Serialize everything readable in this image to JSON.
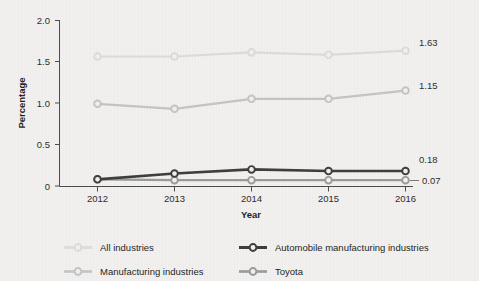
{
  "chart_data": {
    "type": "line",
    "title": "",
    "xlabel": "Year",
    "ylabel": "Percentage",
    "categories": [
      "2012",
      "2013",
      "2014",
      "2015",
      "2016"
    ],
    "x": [
      2012,
      2013,
      2014,
      2015,
      2016
    ],
    "xlim": [
      2011.6,
      2016.0
    ],
    "ylim": [
      0,
      2.0
    ],
    "yticks": [
      "0",
      "0.5",
      "1.0",
      "1.5",
      "2.0"
    ],
    "ytick_values": [
      0,
      0.5,
      1.0,
      1.5,
      2.0
    ],
    "grid": false,
    "legend_position": "bottom",
    "series": [
      {
        "name": "All industries",
        "color": "#dcdcdc",
        "marker": "circle-open",
        "values": [
          1.56,
          1.56,
          1.61,
          1.58,
          1.63
        ],
        "end_label": "1.63"
      },
      {
        "name": "Manufacturing industries",
        "color": "#c4c4c4",
        "marker": "circle-open",
        "values": [
          0.99,
          0.93,
          1.05,
          1.05,
          1.15
        ],
        "end_label": "1.15"
      },
      {
        "name": "Automobile manufacturing industries",
        "color": "#3c3c3c",
        "marker": "circle-open",
        "values": [
          0.08,
          0.15,
          0.2,
          0.18,
          0.18
        ],
        "end_label": "0.18"
      },
      {
        "name": "Toyota",
        "color": "#9a9a9a",
        "marker": "circle-open",
        "values": [
          0.08,
          0.07,
          0.07,
          0.07,
          0.07
        ],
        "end_label": "0.07"
      }
    ],
    "annotations": [
      {
        "text": "1.63",
        "series": "All industries"
      },
      {
        "text": "1.15",
        "series": "Manufacturing industries"
      },
      {
        "text": "0.18",
        "series": "Automobile manufacturing industries"
      },
      {
        "text": "0.07",
        "series": "Toyota"
      }
    ]
  },
  "axes": {
    "y_title": "Percentage",
    "x_title": "Year",
    "y_ticks": [
      "2.0",
      "1.5",
      "1.0",
      "0.5",
      "0"
    ],
    "x_ticks": [
      "2012",
      "2013",
      "2014",
      "2015",
      "2016"
    ]
  },
  "labels": {
    "all_industries_end": "1.63",
    "manufacturing_end": "1.15",
    "automobile_end": "0.18",
    "toyota_end": "0.07"
  },
  "legend": {
    "items": [
      {
        "label": "All industries",
        "color": "#dcdcdc"
      },
      {
        "label": "Automobile manufacturing industries",
        "color": "#3c3c3c"
      },
      {
        "label": "Manufacturing industries",
        "color": "#c4c4c4"
      },
      {
        "label": "Toyota",
        "color": "#9a9a9a"
      }
    ]
  },
  "colors": {
    "background": "#f2f1ef",
    "axis": "#4a4a4a",
    "text": "#1c1c1c",
    "all_industries": "#dcdcdc",
    "manufacturing": "#c4c4c4",
    "automobile": "#3c3c3c",
    "toyota": "#9a9a9a"
  }
}
